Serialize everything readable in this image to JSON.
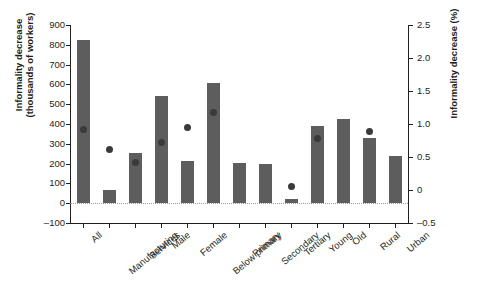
{
  "figure": {
    "top_caption_fragment": "",
    "bottom_caption_fragment": ""
  },
  "chart_data": {
    "type": "bar",
    "title": "",
    "xlabel": "",
    "ylabel": "Informality decrease\n(thousands of workers)",
    "y2label": "Informality decrease (%)",
    "ylim": [
      -100,
      900
    ],
    "y2lim": [
      -0.5,
      2.5
    ],
    "yticks": [
      -100,
      0,
      100,
      200,
      300,
      400,
      500,
      600,
      700,
      800,
      900
    ],
    "ytick_labels": [
      "-100",
      "0",
      "100",
      "200",
      "300",
      "400",
      "500",
      "600",
      "700",
      "800",
      "900"
    ],
    "y2ticks": [
      -0.5,
      0,
      0.5,
      1.0,
      1.5,
      2.0,
      2.5
    ],
    "y2tick_labels": [
      "-0.5",
      "0",
      "0.5",
      "1.0",
      "1.5",
      "2.0",
      "2.5"
    ],
    "grid": false,
    "legend": "none",
    "categories": [
      "All",
      "Manufacturing",
      "Services",
      "Male",
      "Female",
      "Below primary",
      "Primary",
      "Secondary",
      "Tertiary",
      "Young",
      "Old",
      "Rural",
      "Urban"
    ],
    "series": [
      {
        "name": "Informality decrease (thousands of workers)",
        "kind": "bar",
        "axis": "left",
        "color": "#5d5d5d",
        "values": [
          825,
          65,
          255,
          540,
          215,
          605,
          205,
          200,
          20,
          390,
          425,
          330,
          240
        ]
      },
      {
        "name": "Informality decrease (%)",
        "kind": "marker",
        "axis": "right",
        "color": "#3a3a3a",
        "values": [
          0.92,
          0.62,
          0.42,
          0.72,
          0.95,
          1.18,
          null,
          null,
          0.05,
          0.78,
          null,
          0.88,
          null
        ]
      }
    ]
  }
}
